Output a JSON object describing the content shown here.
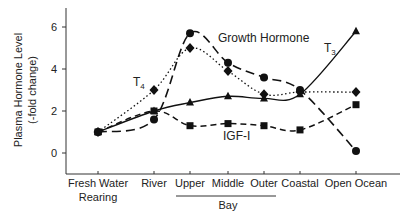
{
  "chart_data": {
    "type": "line",
    "title": "",
    "xlabel": "",
    "ylabel": "Plasma Hormone Level",
    "ylabel_sub": "(-fold change)",
    "ylim": [
      -1,
      7
    ],
    "yticks": [
      0,
      2,
      4,
      6
    ],
    "categories": [
      "Fresh Water Rearing",
      "River",
      "Upper",
      "Middle",
      "Outer",
      "Coastal",
      "Open Ocean"
    ],
    "category_lines": [
      [
        "Fresh Water",
        "Rearing"
      ],
      [
        "River"
      ],
      [
        "Upper"
      ],
      [
        "Middle"
      ],
      [
        "Outer"
      ],
      [
        "Coastal"
      ],
      [
        "Open Ocean"
      ]
    ],
    "group_label": {
      "text": "Bay",
      "spans": [
        "Upper",
        "Middle",
        "Outer"
      ]
    },
    "grid": false,
    "legend": "inline labels",
    "series": [
      {
        "name": "Growth Hormone",
        "marker": "circle",
        "style": "long-dash",
        "values": [
          1.0,
          1.6,
          5.7,
          4.3,
          3.6,
          3.0,
          0.1
        ]
      },
      {
        "name": "T4",
        "marker": "diamond",
        "style": "dotted",
        "values": [
          1.0,
          3.0,
          5.0,
          3.9,
          2.8,
          2.9,
          2.9
        ]
      },
      {
        "name": "T3",
        "marker": "triangle",
        "style": "solid",
        "values": [
          1.0,
          2.0,
          2.4,
          2.7,
          2.6,
          2.8,
          5.8
        ]
      },
      {
        "name": "IGF-I",
        "marker": "square",
        "style": "short-dash",
        "values": [
          1.0,
          2.0,
          1.3,
          1.4,
          1.3,
          1.1,
          2.3
        ]
      }
    ]
  },
  "labels": {
    "gh": "Growth Hormone",
    "t4_main": "T",
    "t4_sub": "4",
    "t3_main": "T",
    "t3_sub": "3",
    "igf": "IGF-I",
    "bay": "Bay"
  }
}
